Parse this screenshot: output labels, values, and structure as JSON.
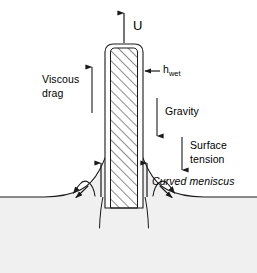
{
  "figure": {
    "background_color": "#ffffff",
    "line_color": "#1a1a1a",
    "bath_fill_color": "#f0f0f0",
    "plate_fill_color": "#ffffff",
    "hatch_color": "#1a1a1a"
  },
  "labels": {
    "velocity": "U",
    "film_thickness_base": "h",
    "film_thickness_subscript": "wet",
    "viscous_drag_line1": "Viscous",
    "viscous_drag_line2": "drag",
    "gravity": "Gravity",
    "surface_tension_line1": "Surface",
    "surface_tension_line2": "tension",
    "curved_meniscus": "Curved meniscus"
  },
  "annotations": {
    "velocity_arrow_direction": "up",
    "viscous_drag_arrow_direction": "up",
    "gravity_arrow_direction": "down",
    "surface_tension_arrow_direction": "down",
    "film_thickness_arrow_direction": "left",
    "flow_arrows_near_plate_direction": "up",
    "recirculation_arrows_direction": "outward-down"
  },
  "geometry": {
    "plate_left_x": 105,
    "plate_right_x": 143,
    "plate_top_y": 44,
    "plate_bottom_y": 208,
    "flat_surface_y": 197,
    "meniscus_contact_y": 148
  }
}
